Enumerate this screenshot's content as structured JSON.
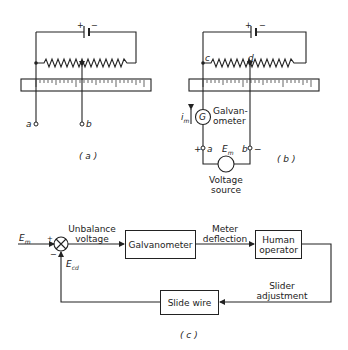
{
  "panel_a": {
    "battery_plus": "+",
    "battery_minus": "−",
    "terminal_a": "a",
    "terminal_b": "b",
    "caption": "( a )"
  },
  "panel_b": {
    "battery_plus": "+",
    "battery_minus": "−",
    "node_c": "c",
    "node_d": "d",
    "current_label": "i",
    "current_sub": "m",
    "galvanometer_symbol": "G",
    "galvanometer_label_1": "Galvan-",
    "galvanometer_label_2": "ometer",
    "terminal_a_plus": "+",
    "terminal_a": "a",
    "emf_label": "E",
    "emf_sub": "m",
    "terminal_b": "b",
    "terminal_b_minus": "−",
    "source_label_1": "Voltage",
    "source_label_2": "source",
    "caption": "( b )"
  },
  "panel_c": {
    "input_label": "E",
    "input_sub": "m",
    "sum_plus": "+",
    "sum_minus": "−",
    "feedback_label": "E",
    "feedback_sub": "cd",
    "unbalance_1": "Unbalance",
    "unbalance_2": "voltage",
    "galvanometer_box": "Galvanometer",
    "meter_1": "Meter",
    "meter_2": "deflection",
    "human_1": "Human",
    "human_2": "operator",
    "slider_1": "Slider",
    "slider_2": "adjustment",
    "slide_wire_box": "Slide wire",
    "caption": "( c )"
  }
}
